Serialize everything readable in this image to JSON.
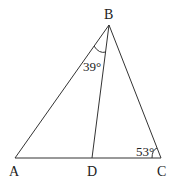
{
  "diagram": {
    "type": "triangle",
    "vertices": {
      "A": {
        "label": "A",
        "x": 15,
        "y": 158
      },
      "B": {
        "label": "B",
        "x": 109,
        "y": 25
      },
      "C": {
        "label": "C",
        "x": 161,
        "y": 158
      },
      "D": {
        "label": "D",
        "x": 92,
        "y": 158
      }
    },
    "segments": [
      "AB",
      "BC",
      "AC",
      "BD"
    ],
    "angles": [
      {
        "at": "B",
        "between": "AB-BD",
        "label": "39°"
      },
      {
        "at": "C",
        "between": "CB-CA",
        "label": "53°"
      }
    ],
    "colors": {
      "stroke": "#333333",
      "text": "#222222",
      "background": "#ffffff"
    }
  }
}
